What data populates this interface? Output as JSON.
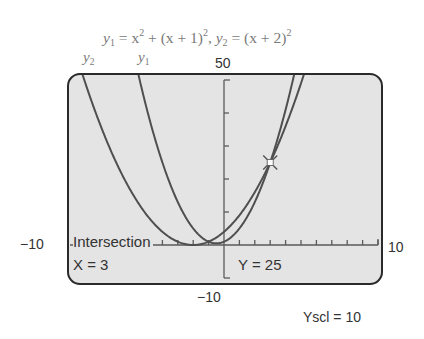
{
  "title": {
    "y1_label": "y",
    "y1_sub": "1",
    "eq1": " = x",
    "eq1_sup": "2",
    "eq1_rest": " + (x + 1)",
    "eq1_rest_sup": "2",
    "sep": ",  ",
    "y2_label": "y",
    "y2_sub": "2",
    "eq2": " = (x + 2)",
    "eq2_sup": "2"
  },
  "curve_labels": {
    "y2": {
      "base": "y",
      "sub": "2"
    },
    "y1": {
      "base": "y",
      "sub": "1"
    }
  },
  "window": {
    "ymax_label": "50",
    "ymin_label": "−10",
    "xmin_label": "−10",
    "xmax_label": "10",
    "yscl_label": "Yscl = 10"
  },
  "screen": {
    "intersection_label": "Intersection",
    "x_readout": "X = 3",
    "y_readout": "Y = 25"
  },
  "colors": {
    "screen_bg": "#e4e4e4",
    "curve": "#4f4f4f",
    "frame": "#2a2a2a",
    "axis": "#5a5a5a",
    "caption": "#7a7a7a"
  },
  "chart_data": {
    "type": "line",
    "xlabel": "",
    "ylabel": "",
    "xlim": [
      -10,
      10
    ],
    "ylim": [
      -10,
      50
    ],
    "xscl": 1,
    "yscl": 10,
    "grid": false,
    "series": [
      {
        "name": "y1",
        "expression": "x^2 + (x+1)^2",
        "x": [
          -6,
          -5,
          -4,
          -3,
          -2,
          -1,
          -0.5,
          0,
          1,
          2,
          3,
          4,
          4.5
        ],
        "values": [
          61,
          41,
          25,
          13,
          5,
          1,
          0.5,
          1,
          5,
          13,
          25,
          41,
          50.5
        ]
      },
      {
        "name": "y2",
        "expression": "(x+2)^2",
        "x": [
          -9,
          -8,
          -7,
          -6,
          -5,
          -4,
          -3,
          -2,
          -1,
          0,
          1,
          2,
          3,
          4,
          5
        ],
        "values": [
          49,
          36,
          25,
          16,
          9,
          4,
          1,
          0,
          1,
          4,
          9,
          16,
          25,
          36,
          49
        ]
      }
    ],
    "annotations": [
      {
        "type": "intersection",
        "x": 3,
        "y": 25,
        "label": "Intersection X = 3, Y = 25"
      }
    ]
  }
}
